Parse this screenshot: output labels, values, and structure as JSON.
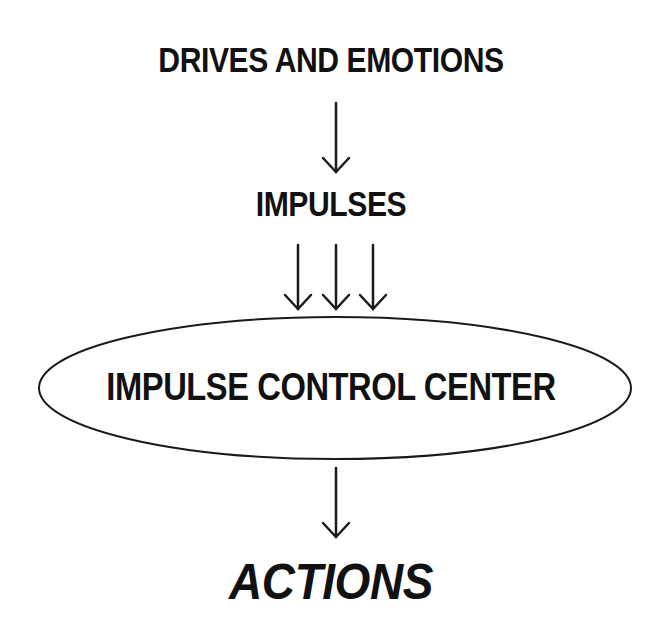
{
  "diagram": {
    "nodes": {
      "drives": "DRIVES AND EMOTIONS",
      "impulses": "IMPULSES",
      "center": "IMPULSE CONTROL CENTER",
      "actions": "ACTIONS"
    },
    "edges": [
      {
        "from": "drives",
        "to": "impulses",
        "count": 1
      },
      {
        "from": "impulses",
        "to": "center",
        "count": 3
      },
      {
        "from": "center",
        "to": "actions",
        "count": 1
      }
    ],
    "colors": {
      "stroke": "#1a1a1a",
      "text": "#111111",
      "background": "#ffffff"
    }
  }
}
